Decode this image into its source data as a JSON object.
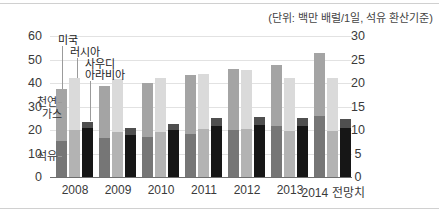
{
  "unit_label": "(단위: 백만 배럴/1일, 석유 환산기준)",
  "annotations": {
    "usa": "미국",
    "russia": "러시아",
    "saudi_line1": "사우디",
    "saudi_line2": "아라비아",
    "gas_line1": "천연",
    "gas_line2": "가스",
    "oil": "석유"
  },
  "chart_data": {
    "type": "bar",
    "stacked": true,
    "title": "",
    "unit": "(단위: 백만 배럴/1일, 석유 환산기준)",
    "categories": [
      "2008",
      "2009",
      "2010",
      "2011",
      "2012",
      "2013",
      "2014 전망치"
    ],
    "series": [
      {
        "name": "미국 석유",
        "country": "usa",
        "fuel": "oil",
        "color": "#767676",
        "values": [
          15.5,
          16.5,
          17,
          18.5,
          20,
          21.5,
          26
        ]
      },
      {
        "name": "미국 천연가스",
        "country": "usa",
        "fuel": "gas",
        "color": "#a4a4a4",
        "values": [
          22,
          22,
          23,
          25,
          26,
          26,
          27
        ]
      },
      {
        "name": "러시아 석유",
        "country": "russia",
        "fuel": "oil",
        "color": "#b3b3b3",
        "values": [
          20,
          19,
          19,
          20.5,
          20.5,
          19.5,
          19.5
        ]
      },
      {
        "name": "러시아 천연가스",
        "country": "russia",
        "fuel": "gas",
        "color": "#dadada",
        "values": [
          22,
          22.5,
          23,
          23.5,
          25,
          22.5,
          22.5
        ]
      },
      {
        "name": "사우디아라비아 석유",
        "country": "saudi",
        "fuel": "oil",
        "color": "#161616",
        "values": [
          21,
          18,
          20,
          21.5,
          22,
          21.5,
          21
        ]
      },
      {
        "name": "사우디아라비아 천연가스",
        "country": "saudi",
        "fuel": "gas",
        "color": "#4f4f4f",
        "values": [
          2.5,
          3,
          2.5,
          3.5,
          3.5,
          3.5,
          4
        ]
      }
    ],
    "left_axis": {
      "label": "",
      "min": 0,
      "max": 60,
      "ticks": [
        0,
        10,
        20,
        30,
        40,
        50,
        60
      ]
    },
    "right_axis": {
      "label": "",
      "min": 0,
      "max": 30,
      "ticks": [
        0,
        5,
        10,
        15,
        20,
        25,
        30
      ]
    },
    "grid": true,
    "legend": false
  },
  "colors": {
    "grid": "#e2e2e2",
    "baseline": "#6e6e6e",
    "leader": "#9b9b9b",
    "text": "#3a3a3a",
    "rule": "#d0d0d0"
  }
}
